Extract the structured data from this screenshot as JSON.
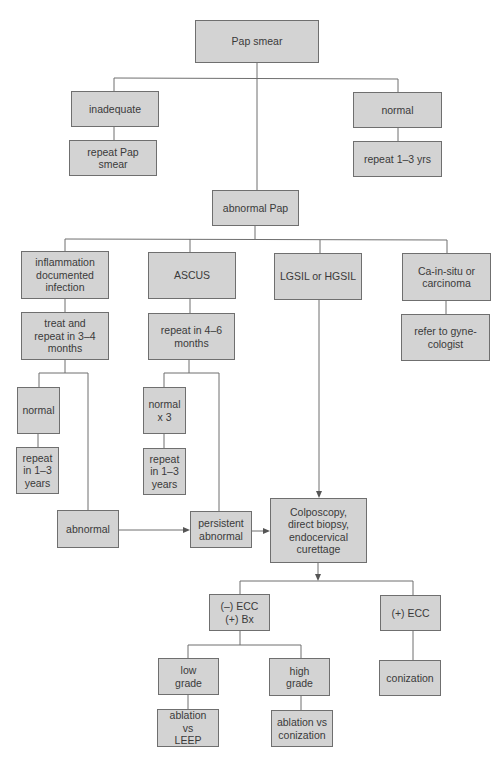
{
  "diagram": {
    "type": "flowchart",
    "colors": {
      "box_fill": "#d3d3d3",
      "box_border": "#6f6f6f",
      "text": "#3a3a3a",
      "line": "#6f6f6f"
    },
    "nodes": {
      "pap_smear": "Pap smear",
      "inadequate": "inadequate",
      "repeat_pap": "repeat Pap\nsmear",
      "normal_top": "normal",
      "repeat_1_3_yrs": "repeat 1–3 yrs",
      "abnormal_pap": "abnormal Pap",
      "inflammation": "inflammation\ndocumented\ninfection",
      "ascus": "ASCUS",
      "lgsil_hgsil": "LGSIL or HGSIL",
      "ca_in_situ": "Ca-in-situ or\ncarcinoma",
      "treat_repeat": "treat and\nrepeat in 3–4\nmonths",
      "repeat_4_6": "repeat in 4–6\nmonths",
      "refer_gyn": "refer to gyne-\ncologist",
      "normal_inflam": "normal",
      "repeat_years_inflam": "repeat\nin 1–3\nyears",
      "normal_x3": "normal\nx 3",
      "repeat_years_ascus": "repeat\nin 1–3\nyears",
      "abnormal_inflam": "abnormal",
      "persistent_abnormal": "persistent\nabnormal",
      "colposcopy": "Colposcopy,\ndirect biopsy,\nendocervical\ncurettage",
      "neg_ecc_pos_bx": "(–) ECC\n(+) Bx",
      "pos_ecc": "(+) ECC",
      "low_grade": "low\ngrade",
      "high_grade": "high\ngrade",
      "conization": "conization",
      "ablation_leep": "ablation\nvs\nLEEP",
      "ablation_conization": "ablation vs\nconization"
    },
    "edges": [
      [
        "pap_smear",
        "inadequate"
      ],
      [
        "pap_smear",
        "abnormal_pap"
      ],
      [
        "pap_smear",
        "normal_top"
      ],
      [
        "inadequate",
        "repeat_pap"
      ],
      [
        "normal_top",
        "repeat_1_3_yrs"
      ],
      [
        "abnormal_pap",
        "inflammation"
      ],
      [
        "abnormal_pap",
        "ascus"
      ],
      [
        "abnormal_pap",
        "lgsil_hgsil"
      ],
      [
        "abnormal_pap",
        "ca_in_situ"
      ],
      [
        "inflammation",
        "treat_repeat"
      ],
      [
        "ascus",
        "repeat_4_6"
      ],
      [
        "ca_in_situ",
        "refer_gyn"
      ],
      [
        "treat_repeat",
        "normal_inflam"
      ],
      [
        "treat_repeat",
        "abnormal_inflam"
      ],
      [
        "normal_inflam",
        "repeat_years_inflam"
      ],
      [
        "repeat_4_6",
        "normal_x3"
      ],
      [
        "repeat_4_6",
        "persistent_abnormal"
      ],
      [
        "normal_x3",
        "repeat_years_ascus"
      ],
      [
        "abnormal_inflam",
        "persistent_abnormal"
      ],
      [
        "persistent_abnormal",
        "colposcopy"
      ],
      [
        "lgsil_hgsil",
        "colposcopy"
      ],
      [
        "colposcopy",
        "neg_ecc_pos_bx"
      ],
      [
        "colposcopy",
        "pos_ecc"
      ],
      [
        "neg_ecc_pos_bx",
        "low_grade"
      ],
      [
        "neg_ecc_pos_bx",
        "high_grade"
      ],
      [
        "low_grade",
        "ablation_leep"
      ],
      [
        "high_grade",
        "ablation_conization"
      ],
      [
        "pos_ecc",
        "conization"
      ]
    ]
  }
}
